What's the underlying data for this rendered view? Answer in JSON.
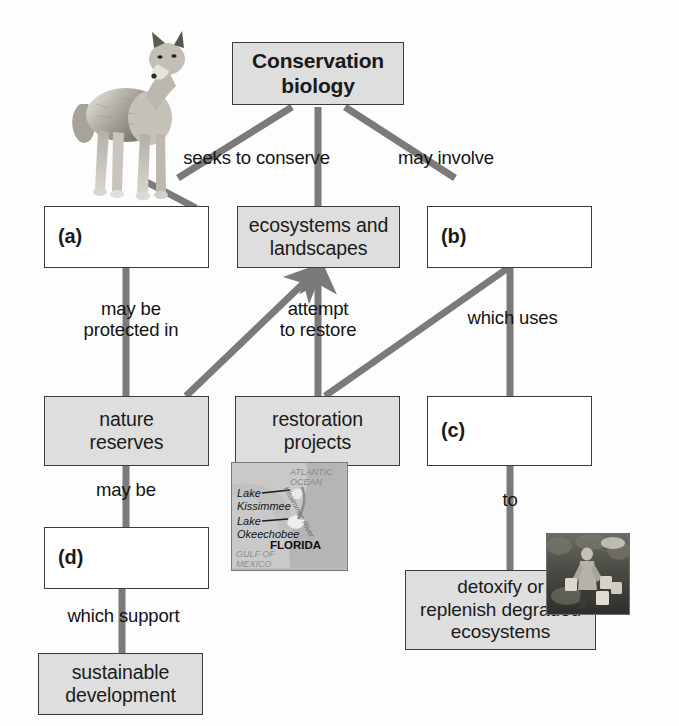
{
  "diagram": {
    "title_node": "Conservation\nbiology",
    "nodes": [
      {
        "id": "root",
        "label": "Conservation\nbiology",
        "style": "shaded",
        "x": 232,
        "y": 42,
        "w": 172,
        "h": 63
      },
      {
        "id": "a",
        "label": "(a)",
        "style": "blank",
        "x": 44,
        "y": 206,
        "w": 165,
        "h": 62
      },
      {
        "id": "ecosystems",
        "label": "ecosystems and\nlandscapes",
        "style": "shaded",
        "x": 237,
        "y": 206,
        "w": 163,
        "h": 62
      },
      {
        "id": "b",
        "label": "(b)",
        "style": "blank",
        "x": 427,
        "y": 206,
        "w": 165,
        "h": 62
      },
      {
        "id": "reserves",
        "label": "nature\nreserves",
        "style": "shaded",
        "x": 44,
        "y": 396,
        "w": 165,
        "h": 70
      },
      {
        "id": "restoration",
        "label": "restoration\nprojects",
        "style": "shaded",
        "x": 235,
        "y": 396,
        "w": 165,
        "h": 70
      },
      {
        "id": "c",
        "label": "(c)",
        "style": "blank",
        "x": 427,
        "y": 396,
        "w": 165,
        "h": 70
      },
      {
        "id": "d",
        "label": "(d)",
        "style": "blank",
        "x": 44,
        "y": 527,
        "w": 165,
        "h": 62
      },
      {
        "id": "detoxify",
        "label": "detoxify or\nreplenish degraded\necosystems",
        "style": "shaded",
        "x": 405,
        "y": 570,
        "w": 191,
        "h": 80
      },
      {
        "id": "sustainable",
        "label": "sustainable\ndevelopment",
        "style": "shaded",
        "x": 38,
        "y": 653,
        "w": 165,
        "h": 62
      }
    ],
    "link_labels": [
      {
        "id": "seeks-to-conserve",
        "text": "seeks to conserve",
        "x": 169,
        "y": 147,
        "w": 175
      },
      {
        "id": "may-involve",
        "text": "may involve",
        "x": 381,
        "y": 147,
        "w": 130
      },
      {
        "id": "may-be-protected-in",
        "text": "may be\nprotected in",
        "x": 56,
        "y": 298,
        "w": 150
      },
      {
        "id": "attempt-to-restore",
        "text": "attempt\nto restore",
        "x": 253,
        "y": 298,
        "w": 130
      },
      {
        "id": "which-uses",
        "text": "which uses",
        "x": 450,
        "y": 307,
        "w": 125
      },
      {
        "id": "may-be",
        "text": "may be",
        "x": 88,
        "y": 479,
        "w": 90
      },
      {
        "id": "to",
        "text": "to",
        "x": 490,
        "y": 489,
        "w": 40
      },
      {
        "id": "which-support",
        "text": "which support",
        "x": 64,
        "y": 605,
        "w": 155
      }
    ],
    "photos": [
      {
        "id": "wolf-photo",
        "alt": "gray wolf standing",
        "x": 68,
        "y": 12,
        "w": 122,
        "h": 196
      },
      {
        "id": "worker-photo",
        "alt": "worker with buckets in field",
        "x": 546,
        "y": 533,
        "w": 82,
        "h": 80
      }
    ],
    "inset_map": {
      "id": "florida-map",
      "x": 231,
      "y": 462,
      "w": 115,
      "h": 107,
      "labels": [
        {
          "id": "atlantic-ocean",
          "text": "ATLANTIC\nOCEAN",
          "x": 58,
          "y": 5,
          "size": 9,
          "style": "italic",
          "color": "#8a8a8a",
          "weight": "normal"
        },
        {
          "id": "kissimmee-river",
          "text": "Kissimmee River",
          "x": 56,
          "y": 18,
          "size": 7.5,
          "style": "italic",
          "color": "#6e6e6e",
          "weight": "normal"
        },
        {
          "id": "lake-kissimmee",
          "text": "Lake\nKissimmee",
          "x": 6,
          "y": 25,
          "size": 11,
          "style": "italic",
          "color": "#141414",
          "weight": "normal"
        },
        {
          "id": "lake-okeechobee",
          "text": "Lake\nOkeechobee",
          "x": 6,
          "y": 52,
          "size": 11,
          "style": "italic",
          "color": "#141414",
          "weight": "normal"
        },
        {
          "id": "florida-label",
          "text": "FLORIDA",
          "x": 40,
          "y": 76,
          "size": 11,
          "style": "normal",
          "color": "#0d0d0d",
          "weight": "bold"
        },
        {
          "id": "gulf-of-mexico",
          "text": "GULF OF\nMEXICO",
          "x": 4,
          "y": 88,
          "size": 9,
          "style": "italic",
          "color": "#8f8f8f",
          "weight": "normal"
        }
      ]
    },
    "colors": {
      "connector": "#7a7a7a",
      "box_border": "#3b3b3b",
      "box_fill_shaded": "#dedede",
      "box_fill_plain": "#ffffff",
      "text": "#1a1a1a",
      "page_bg": "#fdfdfd"
    },
    "connectors": [
      {
        "id": "root-to-a",
        "from": "root",
        "to": "a",
        "kind": "diagonal",
        "arrow": false
      },
      {
        "id": "root-to-ecosystems",
        "from": "root",
        "to": "ecosystems",
        "kind": "vertical",
        "arrow": false
      },
      {
        "id": "root-to-b",
        "from": "root",
        "to": "b",
        "kind": "diagonal",
        "arrow": false
      },
      {
        "id": "a-to-reserves",
        "from": "a",
        "to": "reserves",
        "kind": "vertical",
        "arrow": false
      },
      {
        "id": "restoration-to-ecosystems",
        "from": "restoration",
        "to": "ecosystems",
        "kind": "vertical",
        "arrow": true
      },
      {
        "id": "b-to-c",
        "from": "b",
        "to": "c",
        "kind": "vertical",
        "arrow": false
      },
      {
        "id": "reserves-diag-to-ecosystems",
        "from": "reserves",
        "to": "ecosystems",
        "kind": "diagonal",
        "arrow": true
      },
      {
        "id": "restoration-diag-to-b",
        "from": "restoration",
        "to": "b",
        "kind": "diagonal",
        "arrow": false
      },
      {
        "id": "reserves-to-d",
        "from": "reserves",
        "to": "d",
        "kind": "vertical",
        "arrow": false
      },
      {
        "id": "c-to-detoxify",
        "from": "c",
        "to": "detoxify",
        "kind": "vertical",
        "arrow": false
      },
      {
        "id": "d-to-sustainable",
        "from": "d",
        "to": "sustainable",
        "kind": "vertical",
        "arrow": false
      }
    ]
  }
}
